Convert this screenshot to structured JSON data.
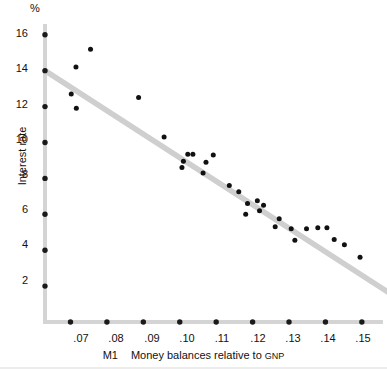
{
  "chart_data": {
    "type": "scatter",
    "title": "",
    "xlabel": "M1   Money balances relative to GNP",
    "xlabel_prefix": "M1",
    "xlabel_main": "Money balances relative to",
    "xlabel_suffix": "GNP",
    "ylabel": "Interest rate",
    "yunit": "%",
    "xlim": [
      0.063,
      0.1558
    ],
    "ylim": [
      0.0,
      16.6
    ],
    "xticks": [
      0.07,
      0.08,
      0.09,
      0.1,
      0.11,
      0.12,
      0.13,
      0.14,
      0.15
    ],
    "xticklabels": [
      ".07",
      ".08",
      ".09",
      ".10",
      ".11",
      ".12",
      ".13",
      ".14",
      ".15"
    ],
    "yticks": [
      2,
      4,
      6,
      8,
      10,
      12,
      14,
      16
    ],
    "yticklabels": [
      "2",
      "4",
      "6",
      "8",
      "10",
      "12",
      "14",
      "16"
    ],
    "grid": false,
    "legend": false,
    "series": [
      {
        "name": "observations",
        "marker": "circle",
        "color": "#111111",
        "points": [
          [
            0.0755,
            15.2
          ],
          [
            0.0715,
            14.2
          ],
          [
            0.0702,
            12.7
          ],
          [
            0.0887,
            12.5
          ],
          [
            0.0716,
            11.9
          ],
          [
            0.0957,
            10.3
          ],
          [
            0.1022,
            9.35
          ],
          [
            0.1036,
            9.35
          ],
          [
            0.1092,
            9.3
          ],
          [
            0.101,
            8.95
          ],
          [
            0.1072,
            8.9
          ],
          [
            0.1006,
            8.6
          ],
          [
            0.1064,
            8.3
          ],
          [
            0.1136,
            7.6
          ],
          [
            0.1162,
            7.25
          ],
          [
            0.1213,
            6.75
          ],
          [
            0.1186,
            6.6
          ],
          [
            0.123,
            6.5
          ],
          [
            0.1219,
            6.2
          ],
          [
            0.1181,
            6.0
          ],
          [
            0.1273,
            5.75
          ],
          [
            0.1262,
            5.3
          ],
          [
            0.1306,
            5.2
          ],
          [
            0.1348,
            5.2
          ],
          [
            0.1379,
            5.25
          ],
          [
            0.1404,
            5.25
          ],
          [
            0.1316,
            4.55
          ],
          [
            0.1424,
            4.6
          ],
          [
            0.1452,
            4.3
          ],
          [
            0.1495,
            3.6
          ]
        ]
      }
    ],
    "trend_line": {
      "name": "fitted regression line",
      "color": "#cfcfcf",
      "x_start": 0.063,
      "y_start": 14.0,
      "x_end": 0.1588,
      "y_end": 1.45
    }
  }
}
